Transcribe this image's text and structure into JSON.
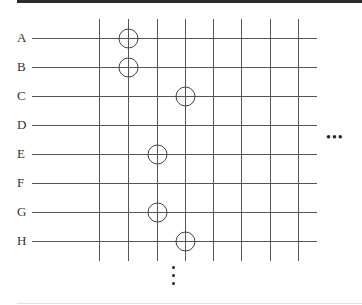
{
  "diagram": {
    "rows": [
      "A",
      "B",
      "C",
      "D",
      "E",
      "F",
      "G",
      "H"
    ],
    "columns": 8,
    "line_color": "#444444",
    "marks": [
      {
        "row": "A",
        "col": 2
      },
      {
        "row": "B",
        "col": 2
      },
      {
        "row": "C",
        "col": 4
      },
      {
        "row": "E",
        "col": 3
      },
      {
        "row": "G",
        "col": 3
      },
      {
        "row": "H",
        "col": 4
      }
    ],
    "continuation_right": "•••",
    "continuation_down": "⋮"
  }
}
